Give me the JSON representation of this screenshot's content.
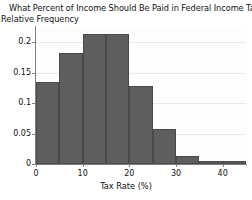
{
  "chart_data": {
    "type": "bar",
    "title": "What Percent of Income Should Be Paid in Federal Income Tax?",
    "ylabel": "Relative Frequency",
    "xlabel": "Tax Rate (%)",
    "grid": true,
    "legend": "none",
    "bin_width": 5,
    "bin_starts": [
      0,
      5,
      10,
      15,
      20,
      25,
      30,
      35,
      40
    ],
    "categories": [
      "0-5",
      "5-10",
      "10-15",
      "15-20",
      "20-25",
      "25-30",
      "30-35",
      "35-40",
      "40-45"
    ],
    "values": [
      0.134,
      0.182,
      0.213,
      0.213,
      0.128,
      0.057,
      0.013,
      0.005,
      0.005
    ],
    "xlim": [
      0,
      45
    ],
    "ylim": [
      0,
      0.223
    ],
    "xticks": [
      0,
      10,
      20,
      30,
      40
    ],
    "xtick_labels": [
      "0",
      "10",
      "20",
      "30",
      "40"
    ],
    "yticks": [
      0,
      0.05,
      0.1,
      0.15,
      0.2
    ],
    "ytick_labels": [
      "0",
      "0.05",
      "0.1",
      "0.15",
      "0.2"
    ],
    "bar_color": "#5e5e5e",
    "bar_edge_color": "#4a4a4a",
    "axis_color": "#808080",
    "grid_color": "#e9e9e9",
    "text_color": "#111111"
  }
}
